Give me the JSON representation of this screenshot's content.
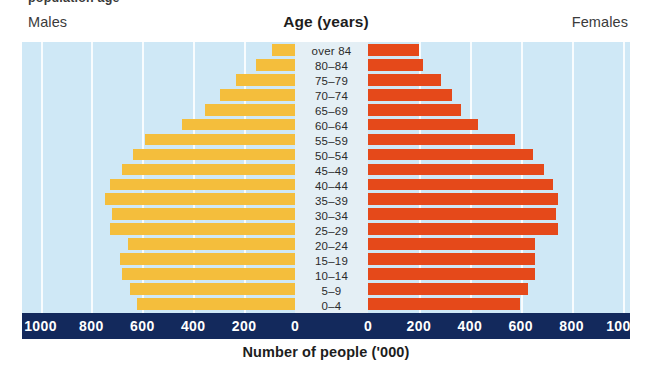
{
  "header": {
    "males_label": "Males",
    "females_label": "Females",
    "age_title": "Age (years)",
    "top_cut_text": "population age"
  },
  "axis": {
    "xlabel": "Number of people ('000)",
    "left_ticks": [
      "1000",
      "800",
      "600",
      "400",
      "200",
      "0"
    ],
    "right_ticks": [
      "0",
      "200",
      "400",
      "600",
      "800",
      "1000"
    ]
  },
  "colors": {
    "male_bar": "#f4be3c",
    "female_bar": "#e5491a",
    "plot_background": "#cfe8f6",
    "label_strip": "#e4eff5",
    "gridline": "#ffffff",
    "axis_band": "#13295c",
    "axis_text": "#ffffff"
  },
  "chart_data": {
    "type": "bar",
    "title": "Age (years)",
    "subtitle": "",
    "xlabel": "Number of people ('000)",
    "ylabel": "Age (years)",
    "orientation": "horizontal",
    "style": "population-pyramid",
    "grid": true,
    "legend_position": "none",
    "xlim": [
      -1000,
      1000
    ],
    "xtick_values": [
      -1000,
      -800,
      -600,
      -400,
      -200,
      0,
      200,
      400,
      600,
      800,
      1000
    ],
    "xtick_labels": [
      "1000",
      "800",
      "600",
      "400",
      "200",
      "0",
      "0",
      "200",
      "400",
      "600",
      "800",
      "1000"
    ],
    "categories": [
      "over 84",
      "80-84",
      "75-79",
      "70-74",
      "65-69",
      "60-64",
      "55-59",
      "50-54",
      "45-49",
      "40-44",
      "35-39",
      "30-34",
      "25-29",
      "20-24",
      "15-19",
      "10-14",
      "5-9",
      "0-4"
    ],
    "series": [
      {
        "name": "Males",
        "side": "left",
        "color": "#f4be3c",
        "values": [
          90,
          153,
          232,
          295,
          354,
          444,
          590,
          637,
          680,
          727,
          746,
          719,
          727,
          656,
          688,
          680,
          648,
          621
        ]
      },
      {
        "name": "Females",
        "side": "right",
        "color": "#e5491a",
        "values": [
          200,
          216,
          287,
          330,
          365,
          432,
          577,
          648,
          691,
          727,
          746,
          738,
          746,
          656,
          656,
          656,
          628,
          597
        ]
      }
    ],
    "units": "thousands of people"
  },
  "rows": [
    {
      "age": "over 84",
      "male": 90,
      "female": 200
    },
    {
      "age": "80-84",
      "male": 153,
      "female": 216
    },
    {
      "age": "75-79",
      "male": 232,
      "female": 287
    },
    {
      "age": "70-74",
      "male": 295,
      "female": 330
    },
    {
      "age": "65-69",
      "male": 354,
      "female": 365
    },
    {
      "age": "60-64",
      "male": 444,
      "female": 432
    },
    {
      "age": "55-59",
      "male": 590,
      "female": 577
    },
    {
      "age": "50-54",
      "male": 637,
      "female": 648
    },
    {
      "age": "45-49",
      "male": 680,
      "female": 691
    },
    {
      "age": "40-44",
      "male": 727,
      "female": 727
    },
    {
      "age": "35-39",
      "male": 746,
      "female": 746
    },
    {
      "age": "30-34",
      "male": 719,
      "female": 738
    },
    {
      "age": "25-29",
      "male": 727,
      "female": 746
    },
    {
      "age": "20-24",
      "male": 656,
      "female": 656
    },
    {
      "age": "15-19",
      "male": 688,
      "female": 656
    },
    {
      "age": "10-14",
      "male": 680,
      "female": 656
    },
    {
      "age": "5-9",
      "male": 648,
      "female": 628
    },
    {
      "age": "0-4",
      "male": 621,
      "female": 597
    }
  ]
}
